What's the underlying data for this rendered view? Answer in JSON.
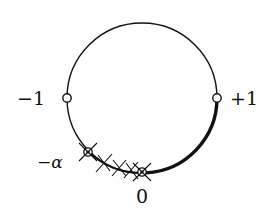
{
  "diagram": {
    "type": "unit-circle-root-locus",
    "labels": {
      "left": "−1",
      "right": "+1",
      "bottom": "0",
      "alpha": "−α"
    },
    "markers": {
      "open_circles": [
        "−1",
        "+1"
      ],
      "crossed_circles": [
        "−α",
        "0"
      ],
      "crosses_count": 3
    },
    "colors": {
      "stroke": "#111111",
      "background": "#ffffff"
    }
  }
}
